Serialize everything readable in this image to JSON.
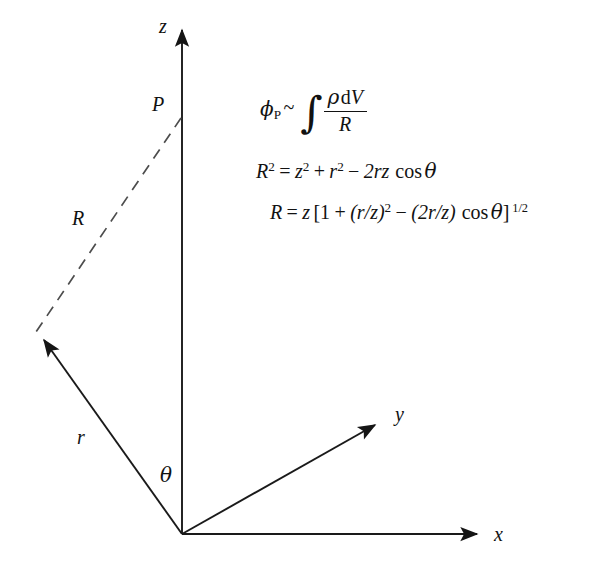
{
  "figure": {
    "kind": "3d-coordinate-vector-diagram",
    "background_color": "#ffffff",
    "line_color": "#1a1a1a",
    "dashed_line_color": "#555555"
  },
  "axes": [
    {
      "name": "z-axis",
      "label": "z",
      "style": "solid-arrow"
    },
    {
      "name": "y-axis",
      "label": "y",
      "style": "solid-arrow"
    },
    {
      "name": "x-axis",
      "label": "x",
      "style": "solid-arrow"
    }
  ],
  "labels": {
    "z_axis": "z",
    "y_axis": "y",
    "x_axis": "x",
    "point_p": "P",
    "vector_r": "r",
    "segment_R": "R",
    "angle_theta": "θ"
  },
  "equations": {
    "line1": {
      "lhs_symbol": "ϕ",
      "lhs_subscript": "P",
      "relation": "~",
      "integral": "∫",
      "numerator_density": "ρ",
      "numerator_volume": "dV",
      "denominator": "R",
      "plain_text": "ϕP ~ ∫ ρ dV / R"
    },
    "line2": {
      "plain_text": "R² = z² + r² − 2rz cos θ",
      "lhs": "R",
      "lhs_exponent": "2",
      "term1": "z",
      "term1_exponent": "2",
      "term2": "r",
      "term2_exponent": "2",
      "term3_coeff": "2rz",
      "trig": "cos",
      "angle": "θ",
      "plus": "+",
      "minus": "−",
      "equals": "="
    },
    "line3": {
      "plain_text": "R = z [1 + (r/z)² − (2r/z) cos θ]^(1/2)",
      "lhs": "R",
      "equals": "=",
      "factor": "z",
      "open_bracket": "[",
      "one": "1",
      "plus": "+",
      "group1": "(r/z)",
      "group1_exponent": "2",
      "minus": "−",
      "group2": "(2r/z)",
      "trig": "cos",
      "angle": "θ",
      "close_bracket": "]",
      "exponent": "1/2"
    }
  }
}
